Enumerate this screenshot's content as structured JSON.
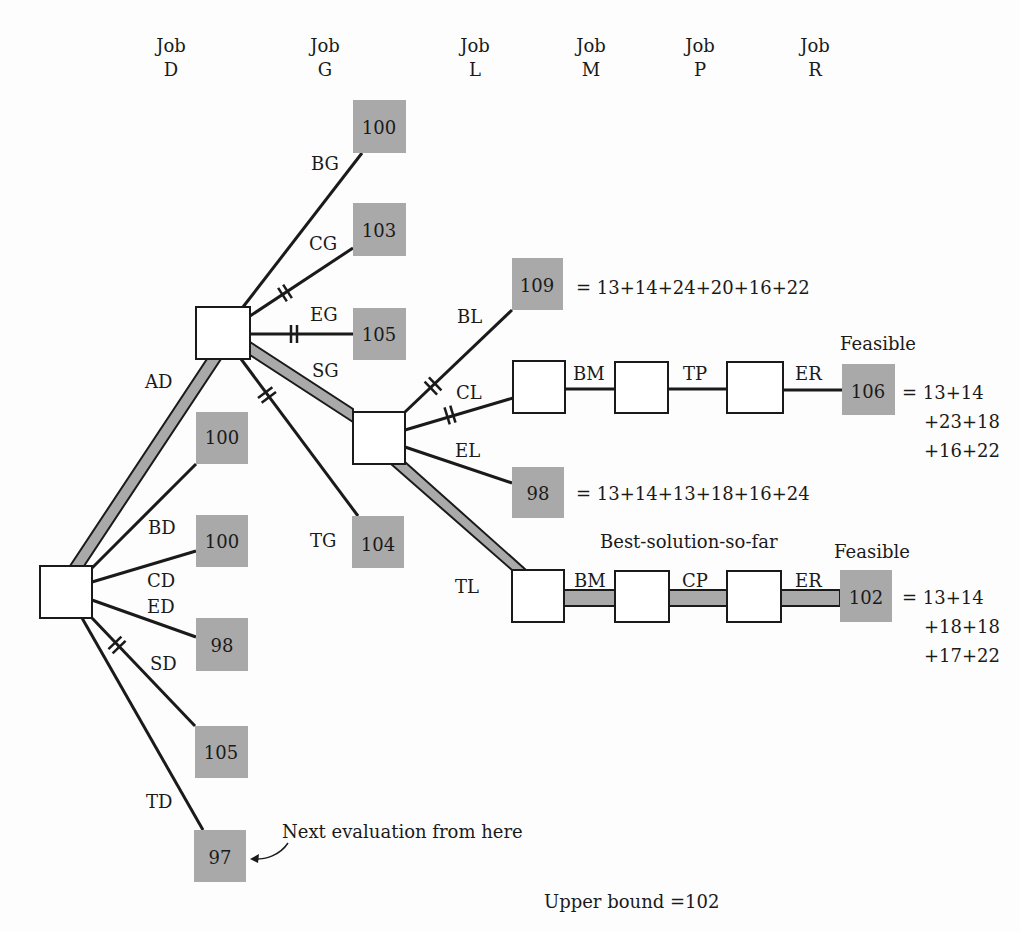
{
  "colors": {
    "bound_fill": "#a9a9a9",
    "node_fill": "#ffffff",
    "line": "#1a1a1a",
    "background": "#fdfdfd"
  },
  "column_headers": [
    {
      "line1": "Job",
      "line2": "D",
      "x": 171
    },
    {
      "line1": "Job",
      "line2": "G",
      "x": 325
    },
    {
      "line1": "Job",
      "line2": "L",
      "x": 475
    },
    {
      "line1": "Job",
      "line2": "M",
      "x": 591
    },
    {
      "line1": "Job",
      "line2": "P",
      "x": 700
    },
    {
      "line1": "Job",
      "line2": "R",
      "x": 815
    }
  ],
  "nodes": {
    "root": {
      "x": 40,
      "y": 566,
      "w": 52,
      "h": 52
    },
    "g_node": {
      "x": 196,
      "y": 307,
      "w": 54,
      "h": 52
    },
    "l_node": {
      "x": 353,
      "y": 412,
      "w": 52,
      "h": 52
    },
    "m_upper": {
      "x": 513,
      "y": 361,
      "w": 52,
      "h": 52
    },
    "p_upper": {
      "x": 615,
      "y": 362,
      "w": 53,
      "h": 51
    },
    "r_upper": {
      "x": 727,
      "y": 362,
      "w": 56,
      "h": 51
    },
    "m_lower": {
      "x": 512,
      "y": 570,
      "w": 52,
      "h": 52
    },
    "p_lower": {
      "x": 615,
      "y": 571,
      "w": 54,
      "h": 51
    },
    "r_lower": {
      "x": 727,
      "y": 571,
      "w": 54,
      "h": 51
    }
  },
  "bounds": [
    {
      "id": "bg",
      "value": "100",
      "x": 353,
      "y": 100,
      "w": 53,
      "h": 53
    },
    {
      "id": "cg",
      "value": "103",
      "x": 353,
      "y": 203,
      "w": 53,
      "h": 53
    },
    {
      "id": "eg",
      "value": "105",
      "x": 353,
      "y": 308,
      "w": 53,
      "h": 52
    },
    {
      "id": "tg",
      "value": "104",
      "x": 352,
      "y": 516,
      "w": 52,
      "h": 52
    },
    {
      "id": "bd",
      "value": "100",
      "x": 196,
      "y": 412,
      "w": 52,
      "h": 52
    },
    {
      "id": "cd",
      "value": "100",
      "x": 196,
      "y": 515,
      "w": 52,
      "h": 52
    },
    {
      "id": "ed",
      "value": "98",
      "x": 196,
      "y": 618,
      "w": 52,
      "h": 53
    },
    {
      "id": "sd",
      "value": "105",
      "x": 195,
      "y": 726,
      "w": 53,
      "h": 52
    },
    {
      "id": "td",
      "value": "97",
      "x": 194,
      "y": 830,
      "w": 52,
      "h": 52
    },
    {
      "id": "bl",
      "value": "109",
      "x": 512,
      "y": 258,
      "w": 51,
      "h": 52
    },
    {
      "id": "el",
      "value": "98",
      "x": 512,
      "y": 467,
      "w": 52,
      "h": 51
    },
    {
      "id": "er_upper",
      "value": "106",
      "x": 842,
      "y": 364,
      "w": 53,
      "h": 51
    },
    {
      "id": "er_lower",
      "value": "102",
      "x": 840,
      "y": 570,
      "w": 52,
      "h": 52
    }
  ],
  "edge_labels": [
    {
      "text": "AD",
      "x": 145,
      "y": 388
    },
    {
      "text": "BD",
      "x": 148,
      "y": 534
    },
    {
      "text": "CD",
      "x": 147,
      "y": 587
    },
    {
      "text": "ED",
      "x": 147,
      "y": 613
    },
    {
      "text": "SD",
      "x": 150,
      "y": 670
    },
    {
      "text": "TD",
      "x": 146,
      "y": 808
    },
    {
      "text": "BG",
      "x": 311,
      "y": 170
    },
    {
      "text": "CG",
      "x": 309,
      "y": 250
    },
    {
      "text": "EG",
      "x": 310,
      "y": 321
    },
    {
      "text": "SG",
      "x": 312,
      "y": 377
    },
    {
      "text": "TG",
      "x": 310,
      "y": 547
    },
    {
      "text": "BL",
      "x": 457,
      "y": 323
    },
    {
      "text": "CL",
      "x": 456,
      "y": 399
    },
    {
      "text": "EL",
      "x": 455,
      "y": 457
    },
    {
      "text": "TL",
      "x": 455,
      "y": 593
    },
    {
      "text": "BM",
      "x": 573,
      "y": 380
    },
    {
      "text": "TP",
      "x": 683,
      "y": 380
    },
    {
      "text": "ER",
      "x": 795,
      "y": 380
    },
    {
      "text": "BM",
      "x": 574,
      "y": 587
    },
    {
      "text": "CP",
      "x": 682,
      "y": 587
    },
    {
      "text": "ER",
      "x": 795,
      "y": 587
    }
  ],
  "annotations": {
    "bl_formula": "= 13+14+24+20+16+22",
    "el_formula": "= 13+14+13+18+16+24",
    "upper_feasible": "Feasible",
    "upper_formula": [
      "= 13+14",
      "+23+18",
      "+16+22"
    ],
    "lower_feasible": "Feasible",
    "best_solution": "Best-solution-so-far",
    "lower_formula": [
      "= 13+14",
      "+18+18",
      "+17+22"
    ],
    "next_eval": "Next evaluation from here",
    "upper_bound": "Upper bound  =102"
  }
}
